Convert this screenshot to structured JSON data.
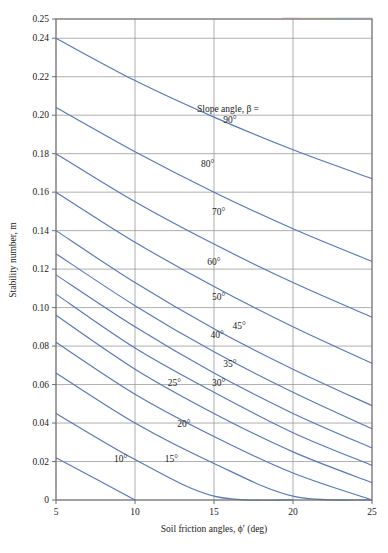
{
  "figure": {
    "background": "#ffffff",
    "plot_border_color": "#6f6f6f",
    "grid_color": "#9a9a9a",
    "curve_color": "#5577bb",
    "text_color": "#1f1f1f"
  },
  "axes": {
    "x_title": "Soil friction angles, ϕ′ (deg)",
    "y_title": "Stability number, m",
    "legend_title": "Slope angle, β =",
    "x_ticks": [
      "5",
      "10",
      "15",
      "20",
      "25"
    ],
    "y_ticks": [
      "0",
      "0.02",
      "0.04",
      "0.06",
      "0.08",
      "0.10",
      "0.12",
      "0.14",
      "0.16",
      "0.18",
      "0.20",
      "0.22",
      "0.24",
      "0.25"
    ]
  },
  "chart_data": {
    "type": "line",
    "title": "",
    "xlabel": "Soil friction angles, ϕ′ (deg)",
    "ylabel": "Stability number, m",
    "legend_title": "Slope angle, β =",
    "legend_position": "inline-on-curves",
    "grid": true,
    "xlim": [
      5,
      25
    ],
    "ylim": [
      0,
      0.25
    ],
    "x": [
      5,
      10,
      15,
      20,
      25
    ],
    "x_ticks": [
      5,
      10,
      15,
      20,
      25
    ],
    "y_ticks": [
      0,
      0.02,
      0.04,
      0.06,
      0.08,
      0.1,
      0.12,
      0.14,
      0.16,
      0.18,
      0.2,
      0.22,
      0.24,
      0.25
    ],
    "series": [
      {
        "name": "90°",
        "label": "90°",
        "label_x": 16.0,
        "label_y": 0.196,
        "values": [
          0.24,
          0.218,
          0.199,
          0.182,
          0.167
        ]
      },
      {
        "name": "80°",
        "label": "80°",
        "label_x": 14.6,
        "label_y": 0.173,
        "values": [
          0.204,
          0.181,
          0.16,
          0.141,
          0.124
        ]
      },
      {
        "name": "70°",
        "label": "70°",
        "label_x": 15.3,
        "label_y": 0.148,
        "values": [
          0.18,
          0.155,
          0.133,
          0.113,
          0.095
        ]
      },
      {
        "name": "60°",
        "label": "60°",
        "label_x": 15.0,
        "label_y": 0.122,
        "values": [
          0.16,
          0.134,
          0.111,
          0.09,
          0.071
        ]
      },
      {
        "name": "50°",
        "label": "50°",
        "label_x": 15.3,
        "label_y": 0.104,
        "values": [
          0.14,
          0.113,
          0.089,
          0.068,
          0.049
        ]
      },
      {
        "name": "45°",
        "label": "45°",
        "label_x": 16.6,
        "label_y": 0.089,
        "values": [
          0.128,
          0.101,
          0.077,
          0.056,
          0.037
        ]
      },
      {
        "name": "40°",
        "label": "40°",
        "label_x": 15.2,
        "label_y": 0.084,
        "values": [
          0.117,
          0.09,
          0.066,
          0.045,
          0.027
        ]
      },
      {
        "name": "35°",
        "label": "35°",
        "label_x": 16.0,
        "label_y": 0.069,
        "values": [
          0.107,
          0.079,
          0.056,
          0.035,
          0.018
        ]
      },
      {
        "name": "30°",
        "label": "30°",
        "label_x": 15.3,
        "label_y": 0.059,
        "values": [
          0.096,
          0.068,
          0.045,
          0.025,
          0.009
        ]
      },
      {
        "name": "25°",
        "label": "25°",
        "label_x": 12.5,
        "label_y": 0.059,
        "values": [
          0.082,
          0.055,
          0.033,
          0.014,
          0.0
        ]
      },
      {
        "name": "20°",
        "label": "20°",
        "label_x": 13.1,
        "label_y": 0.038,
        "values": [
          0.066,
          0.04,
          0.019,
          0.002,
          0.0
        ]
      },
      {
        "name": "15°",
        "label": "15°",
        "label_x": 12.3,
        "label_y": 0.02,
        "values": [
          0.045,
          0.021,
          0.002,
          0.0,
          0.0
        ]
      },
      {
        "name": "10°",
        "label": "10°",
        "label_x": 9.1,
        "label_y": 0.02,
        "values": [
          0.022,
          0.0,
          0.0,
          0.0,
          0.0
        ]
      }
    ]
  }
}
